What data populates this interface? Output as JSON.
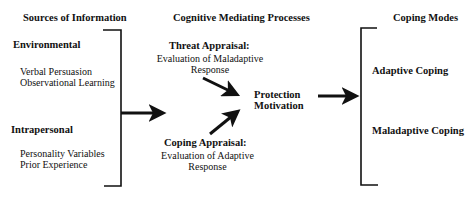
{
  "columns": {
    "sources": {
      "header": "Sources of Information",
      "groups": [
        {
          "title": "Environmental",
          "items": [
            "Verbal Persuasion",
            "Observational Learning"
          ]
        },
        {
          "title": "Intrapersonal",
          "items": [
            "Personality Variables",
            "Prior Experience"
          ]
        }
      ]
    },
    "processes": {
      "header": "Cognitive Mediating Processes",
      "threat": {
        "title": "Threat Appraisal:",
        "line1": "Evaluation of Maladaptive",
        "line2": "Response"
      },
      "coping": {
        "title": "Coping Appraisal:",
        "line1": "Evaluation of Adaptive",
        "line2": "Response"
      },
      "outcome": {
        "line1": "Protection",
        "line2": "Motivation"
      }
    },
    "modes": {
      "header": "Coping Modes",
      "items": [
        "Adaptive Coping",
        "Maladaptive Coping"
      ]
    }
  },
  "colors": {
    "ink": "#111111",
    "background": "#ffffff"
  }
}
